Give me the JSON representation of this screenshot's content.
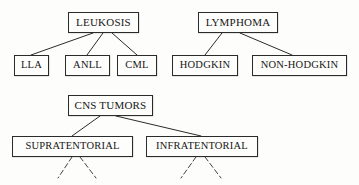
{
  "diagram": {
    "type": "hierarchy-tree",
    "background_color": "#fdfdfb",
    "line_color": "#2b2b2b",
    "text_color": "#161616",
    "trees": [
      {
        "name": "leukosis-tree",
        "root": {
          "id": "leukosis",
          "label": "LEUKOSIS",
          "x": 68,
          "y": 12,
          "w": 71,
          "h": 21
        },
        "children": [
          {
            "id": "lla",
            "label": "LLA",
            "x": 14,
            "y": 55,
            "w": 35,
            "h": 21
          },
          {
            "id": "anll",
            "label": "ANLL",
            "x": 65,
            "y": 55,
            "w": 45,
            "h": 21
          },
          {
            "id": "cml",
            "label": "CML",
            "x": 117,
            "y": 55,
            "w": 40,
            "h": 21
          }
        ]
      },
      {
        "name": "lymphoma-tree",
        "root": {
          "id": "lymphoma",
          "label": "LYMPHOMA",
          "x": 198,
          "y": 12,
          "w": 80,
          "h": 21
        },
        "children": [
          {
            "id": "hodgkin",
            "label": "HODGKIN",
            "x": 172,
            "y": 55,
            "w": 66,
            "h": 21
          },
          {
            "id": "non-hodgkin",
            "label": "NON-HODGKIN",
            "x": 252,
            "y": 55,
            "w": 95,
            "h": 21
          }
        ]
      },
      {
        "name": "cns-tumors-tree",
        "root": {
          "id": "cns-tumors",
          "label": "CNS TUMORS",
          "x": 68,
          "y": 95,
          "w": 85,
          "h": 21
        },
        "children": [
          {
            "id": "supratentorial",
            "label": "SUPRATENTORIAL",
            "x": 12,
            "y": 136,
            "w": 121,
            "h": 21
          },
          {
            "id": "infratentorial",
            "label": "INFRATENTORIAL",
            "x": 146,
            "y": 136,
            "w": 112,
            "h": 21
          }
        ]
      }
    ],
    "connectors": [
      {
        "from": "leukosis",
        "to": "lla",
        "x1": 93,
        "y1": 33,
        "x2": 31,
        "y2": 55
      },
      {
        "from": "leukosis",
        "to": "anll",
        "x1": 103,
        "y1": 33,
        "x2": 87,
        "y2": 55
      },
      {
        "from": "leukosis",
        "to": "cml",
        "x1": 112,
        "y1": 33,
        "x2": 137,
        "y2": 55
      },
      {
        "from": "lymphoma",
        "to": "hodgkin",
        "x1": 222,
        "y1": 33,
        "x2": 205,
        "y2": 55
      },
      {
        "from": "lymphoma",
        "to": "non-hodgkin",
        "x1": 240,
        "y1": 33,
        "x2": 292,
        "y2": 55
      },
      {
        "from": "cns-tumors",
        "to": "supratentorial",
        "x1": 100,
        "y1": 116,
        "x2": 72,
        "y2": 136
      },
      {
        "from": "cns-tumors",
        "to": "infratentorial",
        "x1": 116,
        "y1": 116,
        "x2": 201,
        "y2": 136
      }
    ],
    "dangling_edges": [
      {
        "from": "supratentorial",
        "x1": 72,
        "y1": 157,
        "x2": 58,
        "y2": 178
      },
      {
        "from": "supratentorial",
        "x1": 80,
        "y1": 157,
        "x2": 96,
        "y2": 178
      },
      {
        "from": "infratentorial",
        "x1": 196,
        "y1": 157,
        "x2": 181,
        "y2": 178
      },
      {
        "from": "infratentorial",
        "x1": 205,
        "y1": 157,
        "x2": 221,
        "y2": 178
      }
    ]
  }
}
